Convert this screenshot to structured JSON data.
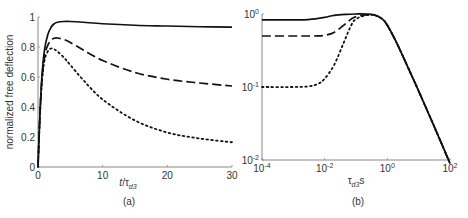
{
  "chart_data": [
    {
      "id": "a",
      "type": "line",
      "caption": "(a)",
      "xlabel": "t/τd3",
      "ylabel": "normalized free deflection",
      "xlim": [
        0,
        30
      ],
      "ylim": [
        0,
        1
      ],
      "xticks": [
        "0",
        "10",
        "20",
        "30"
      ],
      "yticks": [
        "0",
        "0.2",
        "0.4",
        "0.6",
        "0.8",
        "1"
      ],
      "grid": false,
      "legend": null,
      "series": [
        {
          "name": "solid",
          "style": "solid",
          "x": [
            0,
            0.3,
            0.6,
            1,
            1.5,
            2,
            2.5,
            3,
            4,
            5,
            7,
            10,
            15,
            20,
            25,
            30
          ],
          "y": [
            0,
            0.35,
            0.6,
            0.78,
            0.88,
            0.93,
            0.955,
            0.965,
            0.97,
            0.97,
            0.965,
            0.955,
            0.945,
            0.94,
            0.935,
            0.932
          ]
        },
        {
          "name": "dashed",
          "style": "dashed",
          "x": [
            0,
            0.3,
            0.6,
            1,
            1.5,
            2,
            2.5,
            3,
            4,
            5,
            7,
            10,
            15,
            20,
            25,
            30
          ],
          "y": [
            0,
            0.35,
            0.58,
            0.74,
            0.81,
            0.845,
            0.858,
            0.86,
            0.85,
            0.83,
            0.78,
            0.71,
            0.63,
            0.585,
            0.56,
            0.54
          ]
        },
        {
          "name": "dotted",
          "style": "dotted",
          "x": [
            0,
            0.3,
            0.6,
            1,
            1.5,
            2,
            2.5,
            3,
            4,
            5,
            7,
            10,
            15,
            20,
            25,
            30
          ],
          "y": [
            0,
            0.34,
            0.56,
            0.71,
            0.77,
            0.79,
            0.785,
            0.77,
            0.73,
            0.68,
            0.58,
            0.45,
            0.31,
            0.23,
            0.19,
            0.165
          ]
        }
      ]
    },
    {
      "id": "b",
      "type": "line",
      "caption": "(b)",
      "xlabel": "τd3s",
      "ylabel": "",
      "xscale": "log",
      "yscale": "log",
      "xlim": [
        0.0001,
        100
      ],
      "ylim": [
        0.01,
        1
      ],
      "xticks": [
        {
          "base": "10",
          "exp": "-4"
        },
        {
          "base": "10",
          "exp": "-2"
        },
        {
          "base": "10",
          "exp": "0"
        },
        {
          "base": "10",
          "exp": "2"
        }
      ],
      "yticks": [
        {
          "base": "10",
          "exp": "-2"
        },
        {
          "base": "10",
          "exp": "-1"
        },
        {
          "base": "10",
          "exp": "0"
        }
      ],
      "grid": false,
      "legend": null,
      "series": [
        {
          "name": "solid",
          "style": "solid",
          "x": [
            0.0001,
            0.001,
            0.003,
            0.01,
            0.02,
            0.05,
            0.1,
            0.2,
            0.4,
            0.7,
            1,
            2,
            5,
            10,
            30,
            100
          ],
          "y": [
            0.83,
            0.83,
            0.84,
            0.9,
            0.96,
            0.99,
            1.0,
            1.0,
            0.97,
            0.85,
            0.7,
            0.4,
            0.17,
            0.088,
            0.03,
            0.009
          ]
        },
        {
          "name": "dashed",
          "style": "dashed",
          "x": [
            0.0001,
            0.001,
            0.005,
            0.01,
            0.02,
            0.04,
            0.07,
            0.1,
            0.2,
            0.4,
            0.7,
            1,
            2,
            5,
            10,
            30,
            100
          ],
          "y": [
            0.5,
            0.5,
            0.5,
            0.51,
            0.56,
            0.7,
            0.85,
            0.92,
            0.97,
            0.96,
            0.85,
            0.7,
            0.4,
            0.17,
            0.088,
            0.03,
            0.009
          ]
        },
        {
          "name": "dotted",
          "style": "dotted",
          "x": [
            0.0001,
            0.001,
            0.003,
            0.006,
            0.01,
            0.02,
            0.04,
            0.07,
            0.1,
            0.2,
            0.4,
            0.7,
            1,
            2,
            5,
            10,
            30,
            100
          ],
          "y": [
            0.1,
            0.1,
            0.102,
            0.11,
            0.13,
            0.2,
            0.4,
            0.7,
            0.85,
            0.96,
            0.96,
            0.85,
            0.7,
            0.4,
            0.17,
            0.088,
            0.03,
            0.009
          ]
        }
      ]
    }
  ],
  "layout": {
    "a": {
      "x0": 38,
      "x1": 232,
      "y0": 167,
      "y1": 17
    },
    "b": {
      "x0": 262,
      "x1": 450,
      "y0": 160,
      "y1": 14
    }
  },
  "colors": {
    "line": "#111111",
    "axis": "#888888",
    "text": "#333333"
  }
}
